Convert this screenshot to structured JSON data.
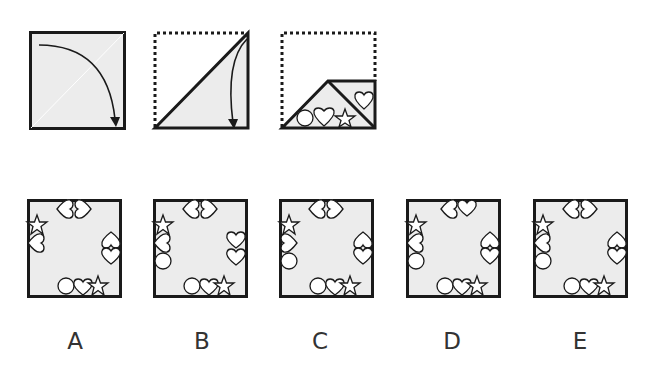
{
  "puzzle": {
    "type": "paper-folding",
    "colors": {
      "paper": "#ececec",
      "stroke": "#1a1a1a",
      "shape_fill": "#ffffff",
      "label": "#333333"
    },
    "steps": [
      {
        "id": "step-1",
        "description": "square sheet folded along diagonal (top-left toward bottom-right)",
        "arrow": "curved-arrow"
      },
      {
        "id": "step-2",
        "description": "triangle folded again, top-right corner down",
        "arrow": "curved-arrow"
      },
      {
        "id": "step-3",
        "description": "folded shape with cut-outs",
        "cutouts": [
          "circle",
          "heart",
          "star",
          "heart"
        ]
      }
    ],
    "options": [
      {
        "id": "A",
        "label": "A"
      },
      {
        "id": "B",
        "label": "B"
      },
      {
        "id": "C",
        "label": "C"
      },
      {
        "id": "D",
        "label": "D"
      },
      {
        "id": "E",
        "label": "E"
      }
    ]
  }
}
